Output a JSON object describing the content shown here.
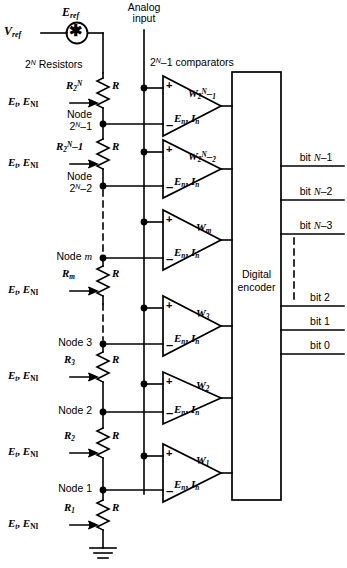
{
  "figure": {
    "line_color": "#000000",
    "background": "#ffffff"
  },
  "source": {
    "vref_label": "V",
    "vref_sub": "ref",
    "eref_label": "E",
    "eref_sub": "ref",
    "symbol": "asterisk-source-icon",
    "symbol_glyph": "✳"
  },
  "ladder": {
    "caption_prefix": "2",
    "caption_sup": "N",
    "caption_suffix": " Resistors",
    "resistor_value": "R",
    "tap_label_e": "E",
    "tap_label_sub1": "t",
    "tap_label_e2": "E",
    "tap_label_sub2": "NI",
    "taps": [
      {
        "name": "R",
        "sub": "2",
        "sup": "N",
        "suffix": "",
        "tap_text": "E t , E NI"
      },
      {
        "name": "R",
        "sub": "2",
        "sup": "N",
        "suffix": "−1",
        "tap_text": "E t , E NI"
      },
      {
        "name": "R",
        "sub": "m",
        "sup": "",
        "suffix": "",
        "tap_text": "E t , E NI"
      },
      {
        "name": "R",
        "sub": "3",
        "sup": "",
        "suffix": "",
        "tap_text": "E t , E NI"
      },
      {
        "name": "R",
        "sub": "2",
        "sup": "",
        "suffix": "",
        "tap_text": "E t , E NI"
      },
      {
        "name": "R",
        "sub": "1",
        "sup": "",
        "suffix": "",
        "tap_text": "E t , E NI"
      }
    ],
    "nodes": [
      {
        "line1": "Node",
        "line2_prefix": "2",
        "line2_sup": "N",
        "line2_suffix": "−1"
      },
      {
        "line1": "Node",
        "line2_prefix": "2",
        "line2_sup": "N",
        "line2_suffix": "−2"
      },
      {
        "line1": "Node m",
        "line2_prefix": "",
        "line2_sup": "",
        "line2_suffix": ""
      },
      {
        "line1": "Node 3",
        "line2_prefix": "",
        "line2_sup": "",
        "line2_suffix": ""
      },
      {
        "line1": "Node 2",
        "line2_prefix": "",
        "line2_sup": "",
        "line2_suffix": ""
      },
      {
        "line1": "Node 1",
        "line2_prefix": "",
        "line2_sup": "",
        "line2_suffix": ""
      }
    ],
    "ground": "ground-symbol"
  },
  "analog_input": {
    "line1": "Analog",
    "line2": "input"
  },
  "comparators": {
    "caption_prefix": "2",
    "caption_sup": "N",
    "caption_suffix": "−1 comparators",
    "plus": "+",
    "minus": "–",
    "noise_e": "E",
    "noise_e_sub": "n",
    "noise_i": "I",
    "noise_i_sub": "n",
    "noise_text": "E n , I n",
    "outputs": [
      {
        "w": "W",
        "sub": "2",
        "sup": "N",
        "suffix": "−1"
      },
      {
        "w": "W",
        "sub": "2",
        "sup": "N",
        "suffix": "−2"
      },
      {
        "w": "W",
        "sub": "m",
        "sup": "",
        "suffix": ""
      },
      {
        "w": "W",
        "sub": "3",
        "sup": "",
        "suffix": ""
      },
      {
        "w": "W",
        "sub": "2",
        "sup": "",
        "suffix": ""
      },
      {
        "w": "W",
        "sub": "1",
        "sup": "",
        "suffix": ""
      }
    ]
  },
  "encoder": {
    "line1": "Digital",
    "line2": "encoder"
  },
  "outputs": {
    "bits": [
      "bit N–1",
      "bit N–2",
      "bit N–3",
      "bit 2",
      "bit 1",
      "bit 0"
    ]
  }
}
